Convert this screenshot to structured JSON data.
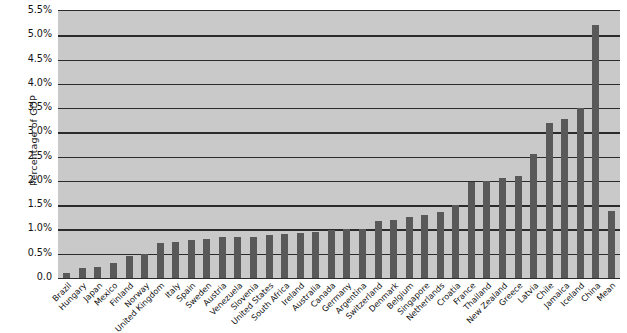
{
  "chart_data": {
    "type": "bar",
    "title": "",
    "subtitle": "",
    "xlabel": "",
    "ylabel": "Percentage of GDP",
    "ylim": [
      0.0,
      5.5
    ],
    "grid": true,
    "legend": "none",
    "y_tick_labels": [
      "5.5%",
      "5.0%",
      "4.5%",
      "4.0%",
      "3.5%",
      "3.0%",
      "2.5%",
      "2.0%",
      "1.5%",
      "1.0%",
      "0.5%",
      "0.0"
    ],
    "y_tick_values": [
      5.5,
      5.0,
      4.5,
      4.0,
      3.5,
      3.0,
      2.5,
      2.0,
      1.5,
      1.0,
      0.5,
      0.0
    ],
    "categories": [
      "Brazil",
      "Hungary",
      "Japan",
      "Mexico",
      "Finland",
      "Norway",
      "United Kingdom",
      "Italy",
      "Spain",
      "Sweden",
      "Austria",
      "Venezuela",
      "Slovenia",
      "United States",
      "South Africa",
      "Ireland",
      "Australia",
      "Canada",
      "Germany",
      "Argentina",
      "Switzerland",
      "Denmark",
      "Belgium",
      "Singapore",
      "Netherlands",
      "Croatia",
      "France",
      "Thailand",
      "New Zealand",
      "Greece",
      "Latvia",
      "Chile",
      "Jamaica",
      "Iceland",
      "China",
      "Mean"
    ],
    "values": [
      0.1,
      0.2,
      0.22,
      0.3,
      0.45,
      0.5,
      0.72,
      0.75,
      0.78,
      0.8,
      0.85,
      0.85,
      0.85,
      0.88,
      0.9,
      0.92,
      0.95,
      0.98,
      1.0,
      1.0,
      1.18,
      1.2,
      1.25,
      1.3,
      1.35,
      1.5,
      1.98,
      2.0,
      2.05,
      2.1,
      2.55,
      3.2,
      3.28,
      3.5,
      5.22,
      1.38
    ],
    "colors": {
      "bar": "#595959",
      "plot_background": "#c9c9c9",
      "gridline": "#2b2b2b",
      "text": "#111111",
      "page_background": "#ffffff"
    }
  }
}
